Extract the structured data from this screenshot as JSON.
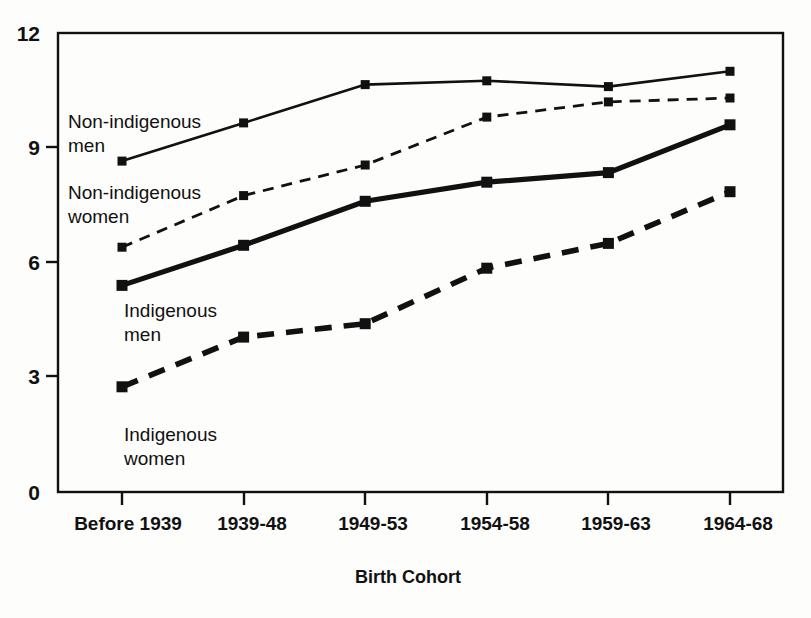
{
  "chart_data": {
    "type": "line",
    "title": "",
    "xlabel": "Birth Cohort",
    "ylabel": "",
    "categories": [
      "Before 1939",
      "1939-48",
      "1949-53",
      "1954-58",
      "1959-63",
      "1964-68"
    ],
    "ylim": [
      0,
      12
    ],
    "yticks": [
      "0",
      "3",
      "6",
      "9",
      "12"
    ],
    "ytick_values": [
      0,
      3,
      6,
      9,
      12
    ],
    "grid": false,
    "legend": "inline-labels",
    "series": [
      {
        "name": "Non-indigenous men",
        "label_lines": [
          "Non-indigenous",
          "men"
        ],
        "style": "solid-thin",
        "color": "#111111",
        "values": [
          8.65,
          9.65,
          10.65,
          10.75,
          10.6,
          11.0
        ]
      },
      {
        "name": "Non-indigenous women",
        "label_lines": [
          "Non-indigenous",
          "women"
        ],
        "style": "dashed-thin",
        "color": "#111111",
        "values": [
          6.4,
          7.75,
          8.55,
          9.8,
          10.2,
          10.3
        ]
      },
      {
        "name": "Indigenous men",
        "label_lines": [
          "Indigenous",
          "men"
        ],
        "style": "solid-thick",
        "color": "#111111",
        "values": [
          5.4,
          6.45,
          7.6,
          8.1,
          8.35,
          9.6
        ]
      },
      {
        "name": "Indigenous women",
        "label_lines": [
          "Indigenous",
          "women"
        ],
        "style": "dashed-thick",
        "color": "#111111",
        "values": [
          2.75,
          4.05,
          4.4,
          5.85,
          6.5,
          7.85
        ]
      }
    ]
  },
  "axis": {
    "y_tick_0": "0",
    "y_tick_1": "3",
    "y_tick_2": "6",
    "y_tick_3": "9",
    "y_tick_4": "12",
    "x_tick_0": "Before 1939",
    "x_tick_1": "1939-48",
    "x_tick_2": "1949-53",
    "x_tick_3": "1954-58",
    "x_tick_4": "1959-63",
    "x_tick_5": "1964-68",
    "x_title": "Birth Cohort"
  },
  "labels": {
    "s0_l0": "Non-indigenous",
    "s0_l1": "men",
    "s1_l0": "Non-indigenous",
    "s1_l1": "women",
    "s2_l0": "Indigenous",
    "s2_l1": "men",
    "s3_l0": "Indigenous",
    "s3_l1": "women"
  }
}
